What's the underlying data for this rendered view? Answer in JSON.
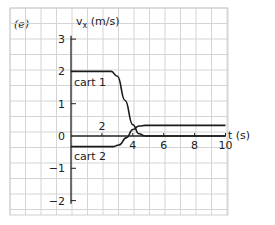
{
  "panel_label": "(e)",
  "chart_data": {
    "type": "line",
    "title": "",
    "xlabel": "t (s)",
    "ylabel": "vx (m/s)",
    "x_ticks": [
      "2",
      "4",
      "6",
      "8",
      "10"
    ],
    "y_ticks": [
      "3",
      "2",
      "1",
      "0",
      "−1",
      "−2"
    ],
    "xlim": [
      0,
      10
    ],
    "ylim": [
      -2.5,
      3.5
    ],
    "grid": true,
    "legend_position": "inline labels",
    "series": [
      {
        "name": "cart 1",
        "x": [
          0,
          2.6,
          3.0,
          3.5,
          4.0,
          4.4,
          4.8,
          10
        ],
        "y": [
          2.0,
          2.0,
          1.85,
          1.1,
          0.35,
          0.07,
          0.0,
          0.0
        ]
      },
      {
        "name": "cart 2",
        "x": [
          0,
          2.7,
          3.1,
          3.6,
          4.0,
          4.4,
          4.8,
          10
        ],
        "y": [
          -0.33,
          -0.33,
          -0.28,
          -0.05,
          0.2,
          0.31,
          0.33,
          0.33
        ]
      }
    ],
    "annotations": [
      "cart 1",
      "cart 2"
    ]
  },
  "labels": {
    "ylabel_v": "v",
    "ylabel_sub": "x",
    "ylabel_unit": " (m/s)",
    "xlabel": "t (s)",
    "cart1": "cart 1",
    "cart2": "cart 2"
  }
}
